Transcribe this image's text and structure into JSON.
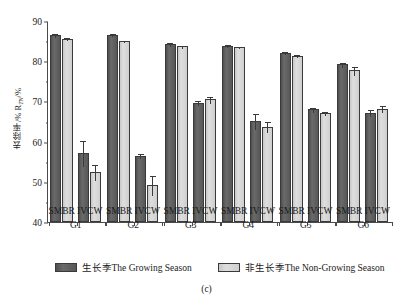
{
  "figure": {
    "caption": "(c)",
    "y_axis_title": "去除率/% R",
    "y_axis_title_sub": "TN",
    "y_axis_title_tail": "/%"
  },
  "legend": {
    "position": "bottom-center",
    "items": [
      {
        "label": "生长季The Growing Season",
        "series": "growing",
        "color": "#595959"
      },
      {
        "label": "非生长季The Non-Growing Season",
        "series": "nongrowing",
        "color": "#d4d4d4"
      }
    ]
  },
  "axes": {
    "y_ticks": [
      "40",
      "50",
      "60",
      "70",
      "80",
      "90"
    ],
    "y_minor_ticks": [
      45,
      55,
      65,
      75,
      85
    ],
    "ylim": [
      40,
      90
    ],
    "x_subgroup_labels": [
      "SMBR",
      "IVCW"
    ],
    "x_group_labels": [
      "G1",
      "G2",
      "G3",
      "G4",
      "G5",
      "G6"
    ]
  },
  "chart_data": {
    "type": "bar",
    "title": "",
    "subtitle": "",
    "xlabel": "",
    "ylabel": "去除率/% R_TN/%",
    "ylim": [
      40,
      90
    ],
    "grid": false,
    "legend_position": "bottom",
    "categories": [
      "G1 SMBR",
      "G1 IVCW",
      "G2 SMBR",
      "G2 IVCW",
      "G3 SMBR",
      "G3 IVCW",
      "G4 SMBR",
      "G4 IVCW",
      "G5 SMBR",
      "G5 IVCW",
      "G6 SMBR",
      "G6 IVCW"
    ],
    "series": [
      {
        "name": "生长季The Growing Season",
        "color": "#595959",
        "values": [
          86.4,
          57.1,
          86.6,
          56.5,
          84.2,
          69.7,
          83.9,
          65.2,
          82.1,
          68.0,
          79.2,
          67.2
        ],
        "errors": [
          0.5,
          3.2,
          0.4,
          0.7,
          0.5,
          0.7,
          0.4,
          2.0,
          0.4,
          0.7,
          0.6,
          0.8
        ]
      },
      {
        "name": "非生长季The Non-Growing Season",
        "color": "#d4d4d4",
        "values": [
          85.6,
          52.5,
          85.0,
          49.2,
          83.7,
          70.5,
          83.6,
          63.7,
          81.4,
          67.0,
          77.7,
          68.2
        ],
        "errors": [
          0.4,
          2.0,
          0.3,
          2.4,
          0.3,
          0.9,
          0.3,
          1.4,
          0.3,
          0.5,
          1.1,
          0.8
        ]
      }
    ]
  }
}
